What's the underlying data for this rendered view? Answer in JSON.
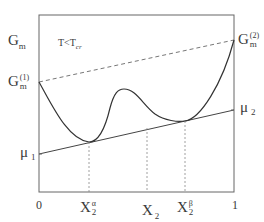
{
  "diagram": {
    "condition": {
      "main": "T<T",
      "sub": "cr"
    },
    "y_labels": {
      "gm": {
        "base": "G",
        "sub": "m"
      },
      "gm1": {
        "base": "G",
        "sub": "m",
        "sup": "(1)"
      },
      "gm2": {
        "base": "G",
        "sub": "m",
        "sup": "(2)"
      },
      "mu1": {
        "base": "μ",
        "sub": "1"
      },
      "mu2": {
        "base": "μ",
        "sub": "2"
      }
    },
    "x_labels": {
      "zero": "0",
      "one": "1",
      "x2_alpha": {
        "base": "X",
        "sub": "2",
        "sup": "α"
      },
      "x2": {
        "base": "X",
        "sub": "2"
      },
      "x2_beta": {
        "base": "X",
        "sub": "2",
        "sup": "β"
      }
    },
    "colors": {
      "axis": "#555555",
      "curve": "#333333",
      "dashed": "#777777"
    }
  }
}
